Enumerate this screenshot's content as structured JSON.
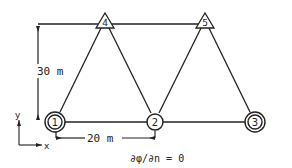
{
  "colors": {
    "stroke": "#222222",
    "background": "#ffffff"
  },
  "nodes": [
    {
      "id": "1",
      "label": "1",
      "shape": "double-circle",
      "x": 55,
      "y": 122
    },
    {
      "id": "2",
      "label": "2",
      "shape": "circle",
      "x": 155,
      "y": 122
    },
    {
      "id": "3",
      "label": "3",
      "shape": "double-circle",
      "x": 255,
      "y": 122
    },
    {
      "id": "4",
      "label": "4",
      "shape": "triangle",
      "x": 105,
      "y": 19
    },
    {
      "id": "5",
      "label": "5",
      "shape": "triangle",
      "x": 205,
      "y": 19
    }
  ],
  "edges": [
    {
      "from": "1",
      "to": "2"
    },
    {
      "from": "2",
      "to": "3"
    },
    {
      "from": "1",
      "to": "4"
    },
    {
      "from": "4",
      "to": "2"
    },
    {
      "from": "2",
      "to": "5"
    },
    {
      "from": "5",
      "to": "3"
    },
    {
      "from": "4",
      "to": "5"
    }
  ],
  "dimensions": {
    "vertical": {
      "label": "30 m"
    },
    "horizontal": {
      "label": "20 m"
    }
  },
  "axes": {
    "x_label": "x",
    "y_label": "y"
  },
  "boundary_condition": "∂φ/∂n = 0"
}
